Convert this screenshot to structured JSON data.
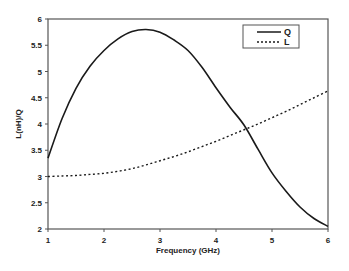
{
  "chart_data": {
    "type": "line",
    "title": "",
    "xlabel": "Frequency (GHz)",
    "ylabel": "L(nH)/Q",
    "xlim": [
      1,
      6
    ],
    "ylim": [
      2,
      6
    ],
    "x_ticks": [
      1,
      2,
      3,
      4,
      5,
      6
    ],
    "x_tick_labels": [
      "1",
      "2",
      "3",
      "4",
      "5",
      "6"
    ],
    "y_ticks": [
      2,
      2.5,
      3,
      3.5,
      4,
      4.5,
      5,
      5.5,
      6
    ],
    "y_tick_labels": [
      "2",
      "2.5",
      "3",
      "3.5",
      "4",
      "4.5",
      "5",
      "5.5",
      "6"
    ],
    "grid": false,
    "legend_position": "upper right",
    "x": [
      1.0,
      1.25,
      1.5,
      1.75,
      2.0,
      2.25,
      2.5,
      2.75,
      3.0,
      3.25,
      3.5,
      3.75,
      4.0,
      4.25,
      4.5,
      4.75,
      5.0,
      5.25,
      5.5,
      5.75,
      6.0
    ],
    "series": [
      {
        "name": "Q",
        "style": "solid",
        "values": [
          3.35,
          4.1,
          4.68,
          5.1,
          5.4,
          5.62,
          5.76,
          5.8,
          5.75,
          5.6,
          5.4,
          5.08,
          4.69,
          4.32,
          3.98,
          3.52,
          3.07,
          2.72,
          2.42,
          2.2,
          2.05
        ]
      },
      {
        "name": "L",
        "style": "dotted",
        "values": [
          3.0,
          3.01,
          3.02,
          3.04,
          3.06,
          3.1,
          3.15,
          3.22,
          3.3,
          3.38,
          3.47,
          3.57,
          3.67,
          3.78,
          3.89,
          4.0,
          4.12,
          4.24,
          4.37,
          4.5,
          4.63
        ]
      }
    ]
  },
  "legend": {
    "items": [
      {
        "label": "Q",
        "style": "solid"
      },
      {
        "label": "L",
        "style": "dotted"
      }
    ]
  },
  "colors": {
    "line": "#1a1a1a",
    "axis": "#555555",
    "background": "#ffffff"
  }
}
